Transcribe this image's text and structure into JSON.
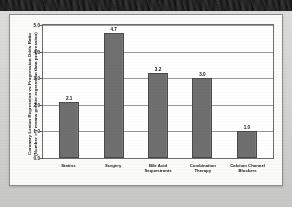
{
  "chart_data": {
    "type": "bar",
    "title": "",
    "xlabel": "",
    "ylabel_lines": [
      "Coronary Lesion Regression vs Progression Odds Ratio",
      "(Number > 1 means greater regression than progression)"
    ],
    "categories": [
      "Statins",
      "Surgery",
      "Bile Acid Sequestrants",
      "Combination Therapy",
      "Calcium Channel Blockers"
    ],
    "category_lines": [
      [
        "Statins"
      ],
      [
        "Surgery"
      ],
      [
        "Bile Acid",
        "Sequestrants"
      ],
      [
        "Combination",
        "Therapy"
      ],
      [
        "Calcium Channel",
        "Blockers"
      ]
    ],
    "values": [
      2.1,
      4.7,
      3.2,
      3.0,
      1.0
    ],
    "value_labels": [
      "2.1",
      "4.7",
      "3.2",
      "3.0",
      "1.0"
    ],
    "ylim": [
      0.0,
      5.0
    ],
    "ytick_values": [
      0.0,
      1.0,
      2.0,
      3.0,
      4.0,
      5.0
    ],
    "ytick_labels": [
      "0.0",
      "1.0",
      "2.0",
      "3.0",
      "4.0",
      "5.0"
    ],
    "grid": "horizontal",
    "legend": "none",
    "colors": {
      "bar_fill": "#6f6f6f",
      "bar_border": "#4a4a4a",
      "plot_background": "#ffffff",
      "gridline": "#9a9a9a",
      "axis": "#6d6d6d",
      "text": "#1a1a1a",
      "page_background": "#d2d2d0",
      "card_background": "#fbfbfa"
    }
  }
}
